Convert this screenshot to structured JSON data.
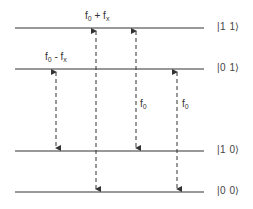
{
  "diagram": {
    "type": "energy-level-diagram",
    "levels": [
      {
        "state": "11",
        "ket": "|1 1⟩",
        "y": 28
      },
      {
        "state": "01",
        "ket": "|0 1⟩",
        "y": 69
      },
      {
        "state": "10",
        "ket": "|1 0⟩",
        "y": 151
      },
      {
        "state": "00",
        "ket": "|0 0⟩",
        "y": 192
      }
    ],
    "transitions": [
      {
        "from": "01",
        "to": "10",
        "x": 56,
        "label_base": "f",
        "label_sub": "0",
        "label_op": " - ",
        "label_base2": "f",
        "label_sub2": "x"
      },
      {
        "from": "11",
        "to": "00",
        "x": 96,
        "label_base": "f",
        "label_sub": "0",
        "label_op": " + ",
        "label_base2": "f",
        "label_sub2": "x"
      },
      {
        "from": "11",
        "to": "10",
        "x": 136,
        "label_base": "f",
        "label_sub": "0"
      },
      {
        "from": "01",
        "to": "00",
        "x": 177,
        "label_base": "f",
        "label_sub": "0"
      }
    ],
    "line_color": "#333333"
  }
}
